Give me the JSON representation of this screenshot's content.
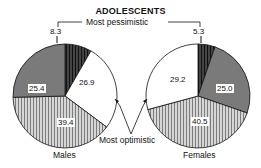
{
  "chart_data": [
    {
      "type": "pie",
      "title": "ADOLESCENTS",
      "group": "Males",
      "slices": [
        {
          "label": "Most pessimistic",
          "value": 8.3,
          "pattern": "dark-stripes"
        },
        {
          "label": "",
          "value": 26.9,
          "pattern": "white"
        },
        {
          "label": "Most optimistic",
          "value": 39.4,
          "pattern": "light-stripes"
        },
        {
          "label": "",
          "value": 25.4,
          "pattern": "dark-gray"
        }
      ]
    },
    {
      "type": "pie",
      "title": "ADOLESCENTS",
      "group": "Females",
      "slices": [
        {
          "label": "Most pessimistic",
          "value": 5.3,
          "pattern": "dark-stripes"
        },
        {
          "label": "",
          "value": 25.0,
          "pattern": "dark-gray"
        },
        {
          "label": "Most optimistic",
          "value": 40.5,
          "pattern": "light-stripes"
        },
        {
          "label": "",
          "value": 29.2,
          "pattern": "white"
        }
      ]
    }
  ],
  "labels": {
    "title": "ADOLESCENTS",
    "most_pessimistic": "Most pessimistic",
    "most_optimistic": "Most optimistic",
    "males": "Males",
    "females": "Females",
    "m_pess": "8.3",
    "m_white": "26.9",
    "m_opt": "39.4",
    "m_gray": "25.4",
    "f_pess": "5.3",
    "f_gray": "25.0",
    "f_opt": "40.5",
    "f_white": "29.2"
  }
}
